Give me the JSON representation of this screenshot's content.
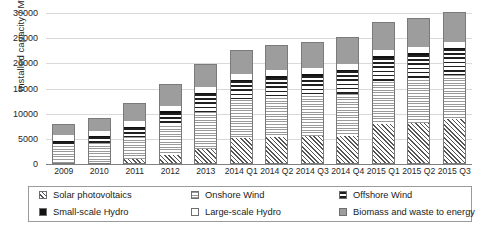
{
  "chart_data": {
    "type": "bar",
    "subtype": "stacked",
    "title": "",
    "xlabel": "",
    "ylabel": "Installed capacity / MW",
    "ylim": [
      0,
      30000
    ],
    "yticks": [
      0,
      5000,
      10000,
      15000,
      20000,
      25000,
      30000
    ],
    "ytick_labels": [
      "0",
      "5000",
      "10000",
      "15000",
      "20000",
      "25000",
      "30000"
    ],
    "grid": true,
    "grid_axis": "y",
    "legend_position": "bottom",
    "categories": [
      "2009",
      "2010",
      "2011",
      "2012",
      "2013",
      "2014 Q1",
      "2014 Q2",
      "2014 Q3",
      "2014 Q4",
      "2015 Q1",
      "2015 Q2",
      "2015 Q3"
    ],
    "series": [
      {
        "name": "Solar photovoltaics",
        "pattern": "diagonal-hatch",
        "values": [
          30,
          80,
          800,
          1700,
          2800,
          5000,
          5200,
          5400,
          5500,
          7800,
          8000,
          8800
        ]
      },
      {
        "name": "Onshore Wind",
        "pattern": "fine-horizontal-lines",
        "values": [
          3500,
          4000,
          4600,
          5900,
          7500,
          7800,
          8000,
          8200,
          8500,
          8600,
          8800,
          9000
        ]
      },
      {
        "name": "Offshore Wind",
        "pattern": "wide-horizontal-lines",
        "values": [
          950,
          1350,
          1850,
          2700,
          3700,
          3700,
          4000,
          4000,
          4500,
          4800,
          5000,
          5100
        ]
      },
      {
        "name": "Small-scale Hydro",
        "pattern": "solid-black",
        "values": [
          200,
          220,
          240,
          260,
          280,
          300,
          310,
          320,
          330,
          340,
          350,
          360
        ]
      },
      {
        "name": "Large-scale Hydro",
        "pattern": "white",
        "values": [
          1100,
          1100,
          1150,
          1150,
          1200,
          1200,
          1200,
          1200,
          1200,
          1200,
          1200,
          1200
        ]
      },
      {
        "name": "Biomass and waste to energy",
        "pattern": "solid-gray",
        "values": [
          2100,
          2400,
          3400,
          4100,
          4400,
          4700,
          4900,
          5100,
          5300,
          5500,
          5700,
          5800
        ]
      }
    ],
    "totals": [
      7880,
      9150,
      12040,
      15810,
      19880,
      22700,
      23610,
      24220,
      25330,
      28240,
      29050,
      30260
    ]
  },
  "legend": {
    "items": [
      {
        "label": "Solar photovoltaics",
        "pattern": "diagonal-hatch"
      },
      {
        "label": "Onshore Wind",
        "pattern": "fine-horizontal-lines"
      },
      {
        "label": "Offshore Wind",
        "pattern": "wide-horizontal-lines"
      },
      {
        "label": "Small-scale Hydro",
        "pattern": "solid-black"
      },
      {
        "label": "Large-scale Hydro",
        "pattern": "white"
      },
      {
        "label": "Biomass and waste to energy",
        "pattern": "solid-gray"
      }
    ]
  },
  "colors": {
    "gridline": "#d9d9d9",
    "axis": "#808080",
    "bar_outline": "#7a7a7a",
    "biomass_gray": "#9d9d9d",
    "small_hydro_black": "#121212",
    "text": "#262626"
  }
}
